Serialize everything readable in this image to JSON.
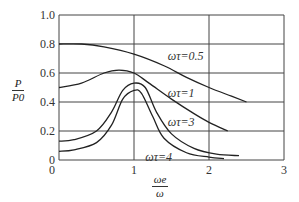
{
  "chart_data": {
    "type": "line",
    "title": "",
    "xlabel": "ωe/ω",
    "ylabel": "P/P0",
    "xlim": [
      0,
      3
    ],
    "ylim": [
      0,
      1.0
    ],
    "x_ticks": [
      "0",
      "1",
      "2",
      "3"
    ],
    "y_ticks": [
      "0",
      "0.2",
      "0.4",
      "0.6",
      "0.8",
      "1.0"
    ],
    "grid": true,
    "legend": "inline labels",
    "series": [
      {
        "name": "ωτ=0.5",
        "label_pos": [
          1.45,
          0.72
        ],
        "x": [
          0,
          0.3,
          0.6,
          1.0,
          1.4,
          1.7,
          2.0,
          2.3,
          2.5
        ],
        "y": [
          0.8,
          0.8,
          0.78,
          0.73,
          0.65,
          0.57,
          0.5,
          0.44,
          0.4
        ]
      },
      {
        "name": "ωτ=1",
        "label_pos": [
          1.45,
          0.46
        ],
        "x": [
          0,
          0.3,
          0.6,
          0.8,
          1.0,
          1.2,
          1.5,
          1.8,
          2.0,
          2.25
        ],
        "y": [
          0.5,
          0.53,
          0.6,
          0.62,
          0.6,
          0.53,
          0.42,
          0.32,
          0.26,
          0.2
        ]
      },
      {
        "name": "ωτ=3",
        "label_pos": [
          1.45,
          0.26
        ],
        "x": [
          0,
          0.2,
          0.5,
          0.7,
          0.85,
          1.0,
          1.15,
          1.3,
          1.5,
          1.8,
          2.1,
          2.4
        ],
        "y": [
          0.13,
          0.14,
          0.2,
          0.33,
          0.48,
          0.53,
          0.5,
          0.33,
          0.18,
          0.08,
          0.04,
          0.03
        ]
      },
      {
        "name": "ωτ=4",
        "label_pos": [
          1.15,
          0.02
        ],
        "x": [
          0,
          0.2,
          0.5,
          0.7,
          0.85,
          1.0,
          1.1,
          1.25,
          1.4,
          1.7,
          2.0,
          2.2
        ],
        "y": [
          0.06,
          0.07,
          0.12,
          0.24,
          0.42,
          0.48,
          0.46,
          0.3,
          0.15,
          0.05,
          0.02,
          0.01
        ]
      }
    ]
  },
  "labels": {
    "ylabel_num": "P",
    "ylabel_den": "P0",
    "xlabel_num": "ωe",
    "xlabel_den": "ω"
  }
}
